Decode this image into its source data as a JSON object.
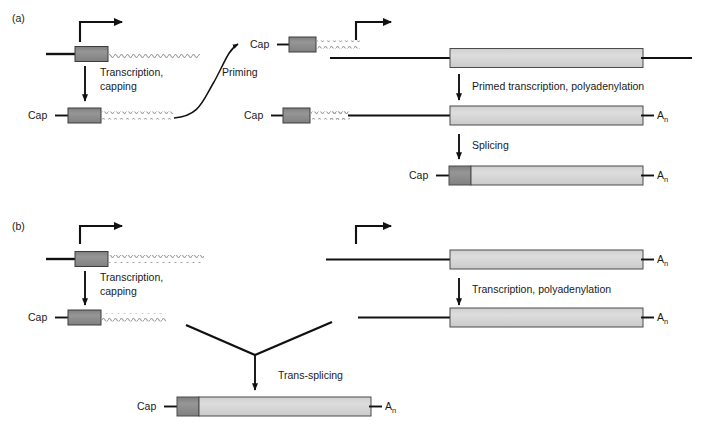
{
  "figure": {
    "type": "biology-process-diagram",
    "title_visible": false,
    "background_color": "#ffffff",
    "colors": {
      "dark_gray_box": "#8a8a8a",
      "dark_gray_box_stroke": "#3c3c3c",
      "light_gray_box": "#d6d6d6",
      "light_gray_box_stroke": "#4a4a4a",
      "line_black": "#111111",
      "wavy_rna_gray": "#9b9b9b",
      "text": "#1a1a1a"
    }
  },
  "panels": [
    {
      "id": "a",
      "label": "(a)",
      "label_x": 12,
      "label_y": 18,
      "steps": [
        {
          "name": "transcription-capping",
          "label_line1": "Transcription,",
          "label_line2": "capping"
        },
        {
          "name": "priming",
          "label": "Priming"
        },
        {
          "name": "primed-transcription-polyadenylation",
          "label": "Primed transcription, polyadenylation"
        },
        {
          "name": "splicing",
          "label": "Splicing"
        }
      ],
      "molecule_labels": {
        "cap": "Cap",
        "poly_a": "A",
        "poly_a_subscript": "n"
      }
    },
    {
      "id": "b",
      "label": "(b)",
      "label_x": 12,
      "label_y": 226,
      "steps": [
        {
          "name": "transcription-capping",
          "label_line1": "Transcription,",
          "label_line2": "capping"
        },
        {
          "name": "transcription-polyadenylation",
          "label": "Transcription, polyadenylation"
        },
        {
          "name": "trans-splicing",
          "label": "Trans-splicing"
        }
      ],
      "molecule_labels": {
        "cap": "Cap",
        "poly_a": "A",
        "poly_a_subscript": "n"
      }
    }
  ],
  "labels": {
    "panel_a": "(a)",
    "panel_b": "(b)",
    "transcription_capping_l1": "Transcription,",
    "transcription_capping_l2": "capping",
    "priming": "Priming",
    "primed_transcription_polyadenylation": "Primed transcription, polyadenylation",
    "splicing": "Splicing",
    "transcription_polyadenylation": "Transcription, polyadenylation",
    "trans_splicing": "Trans-splicing",
    "cap": "Cap",
    "an_base": "A",
    "an_sub": "n"
  }
}
